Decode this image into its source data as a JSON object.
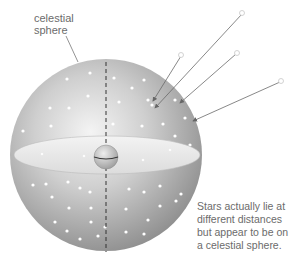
{
  "labels": {
    "sphere": [
      "celestial",
      "sphere"
    ],
    "caption": [
      "Stars actually lie at",
      "different distances",
      "but appear to be on",
      "a celestial sphere."
    ]
  },
  "colors": {
    "sphere_light": "#f2f2f2",
    "sphere_dark": "#9a9a9a",
    "plane": "#e9e9e9",
    "star": "#ffffff",
    "arrow": "#666666",
    "text": "#6b6b6b"
  },
  "geometry": {
    "sphere_center": [
      106,
      155
    ],
    "sphere_radius": 96,
    "earth_center": [
      106,
      157
    ],
    "earth_radius": 13
  }
}
